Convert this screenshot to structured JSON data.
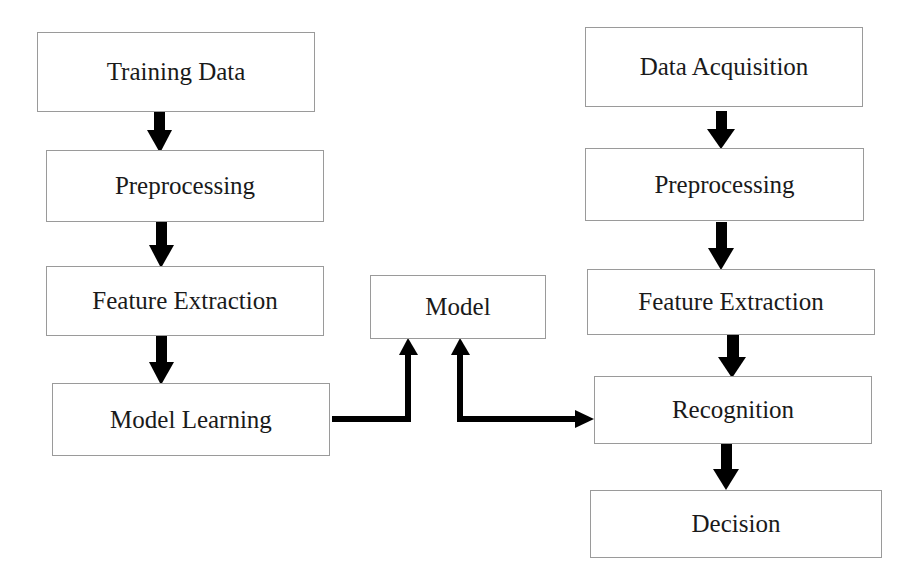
{
  "diagram": {
    "type": "flowchart",
    "training_pipeline": [
      {
        "id": "training-data",
        "label": "Training Data"
      },
      {
        "id": "train-preprocessing",
        "label": "Preprocessing"
      },
      {
        "id": "train-feature-extraction",
        "label": "Feature Extraction"
      },
      {
        "id": "model-learning",
        "label": "Model Learning"
      }
    ],
    "model": {
      "id": "model",
      "label": "Model"
    },
    "recognition_pipeline": [
      {
        "id": "data-acquisition",
        "label": "Data Acquisition"
      },
      {
        "id": "rec-preprocessing",
        "label": "Preprocessing"
      },
      {
        "id": "rec-feature-extraction",
        "label": "Feature Extraction"
      },
      {
        "id": "recognition",
        "label": "Recognition"
      },
      {
        "id": "decision",
        "label": "Decision"
      }
    ],
    "edges": [
      {
        "from": "Training Data",
        "to": "Preprocessing (training)"
      },
      {
        "from": "Preprocessing (training)",
        "to": "Feature Extraction (training)"
      },
      {
        "from": "Feature Extraction (training)",
        "to": "Model Learning"
      },
      {
        "from": "Model Learning",
        "to": "Model"
      },
      {
        "from": "Model",
        "to": "Recognition",
        "bidirectional": true
      },
      {
        "from": "Data Acquisition",
        "to": "Preprocessing (recognition)"
      },
      {
        "from": "Preprocessing (recognition)",
        "to": "Feature Extraction (recognition)"
      },
      {
        "from": "Feature Extraction (recognition)",
        "to": "Recognition"
      },
      {
        "from": "Recognition",
        "to": "Decision"
      }
    ],
    "colors": {
      "arrow": "#000000",
      "box_border": "#9a9a9a",
      "text": "#1a1a1a",
      "background": "#ffffff"
    }
  }
}
